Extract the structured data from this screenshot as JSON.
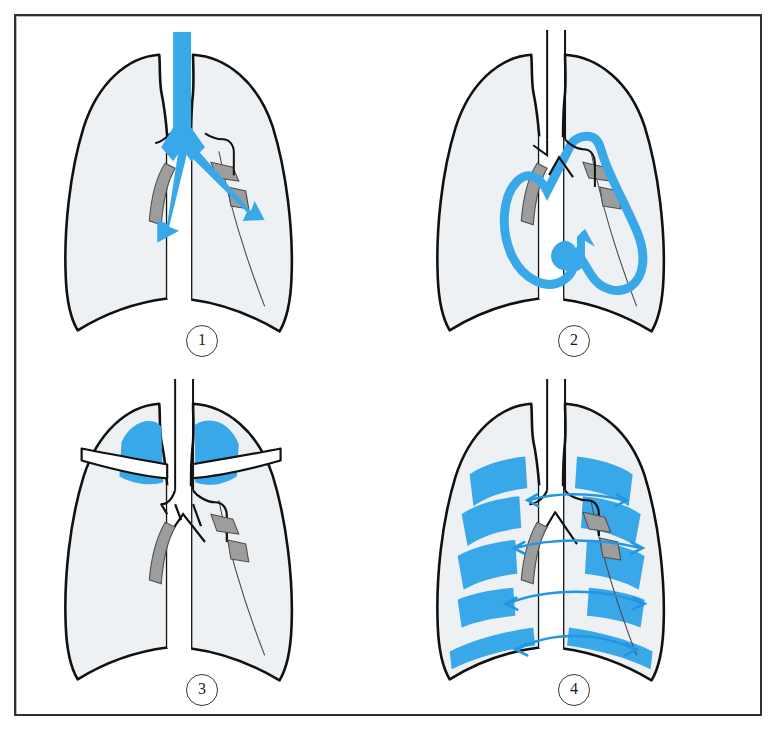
{
  "figure": {
    "background_color": "#ffffff",
    "frame_color": "#2e3033"
  },
  "palette": {
    "accent_blue": "#39a8e8",
    "accent_blue_dark": "#1f96dd",
    "lung_fill": "#eef1f3",
    "hilum_gray": "#9d9d9d",
    "hilum_gray_dark": "#8a8a8a",
    "outline_black": "#111111",
    "thin_line": "#3a3a3a"
  },
  "panels": [
    {
      "id": "panel-1",
      "number": "1",
      "caption": "Airway inflow: trachea and main bronchi highlighted with downward-outward arrows",
      "elements": [
        "left-lung-outline",
        "right-lung-outline",
        "diaphragm-curve",
        "trachea-blue-column",
        "bronchial-Y-blue",
        "left-bronchus-arrow",
        "right-bronchus-arrow",
        "hilar-shadow-left",
        "hilar-shadow-right-upper",
        "hilar-shadow-right-lower"
      ]
    },
    {
      "id": "panel-2",
      "number": "2",
      "caption": "Cardiac silhouette traced in blue with circular upward arrow",
      "elements": [
        "left-lung-outline",
        "right-lung-outline",
        "diaphragm-curve",
        "trachea-outline",
        "heart-border-blue-loop",
        "upward-curl-arrow",
        "hilar-shadow-left",
        "hilar-shadow-right-upper",
        "hilar-shadow-right-lower"
      ]
    },
    {
      "id": "panel-3",
      "number": "3",
      "caption": "Apical (upper zone) fields shaded blue with clavicles overlaid",
      "elements": [
        "left-lung-outline",
        "right-lung-outline",
        "diaphragm-curve",
        "trachea-outline",
        "bronchial-Y-outline",
        "apex-blue-left",
        "apex-blue-right",
        "clavicle-left",
        "clavicle-right",
        "hilar-shadow-left",
        "hilar-shadow-right-upper",
        "hilar-shadow-right-lower"
      ]
    },
    {
      "id": "panel-4",
      "number": "4",
      "caption": "Peripheral lung zones blocked in blue with four horizontal comparison arrows",
      "elements": [
        "left-lung-outline",
        "right-lung-outline",
        "diaphragm-curve",
        "trachea-outline",
        "bronchial-Y-outline",
        "peripheral-blocks-left",
        "peripheral-blocks-right",
        "diaphragm-band-left",
        "diaphragm-band-right",
        "comparison-arrow-1",
        "comparison-arrow-2",
        "comparison-arrow-3",
        "comparison-arrow-4",
        "hilar-shadow-left",
        "hilar-shadow-right-upper",
        "hilar-shadow-right-lower"
      ],
      "arrow_count": 4
    }
  ]
}
